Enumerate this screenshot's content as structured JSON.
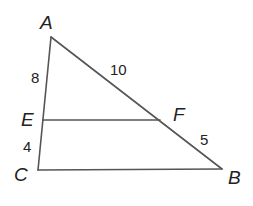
{
  "diagram": {
    "type": "triangle-with-parallel-segment",
    "stroke_color": "#555555",
    "text_color": "#222222",
    "vertices": {
      "A": {
        "label": "A",
        "x": 51,
        "y": 37
      },
      "B": {
        "label": "B",
        "x": 222,
        "y": 169
      },
      "C": {
        "label": "C",
        "x": 38,
        "y": 170
      },
      "E": {
        "label": "E",
        "x": 43,
        "y": 120
      },
      "F": {
        "label": "F",
        "x": 160,
        "y": 120
      }
    },
    "segments": [
      {
        "from": "A",
        "to": "C"
      },
      {
        "from": "A",
        "to": "B"
      },
      {
        "from": "C",
        "to": "B"
      },
      {
        "from": "E",
        "to": "F"
      }
    ],
    "measurements": {
      "AE": "8",
      "EC": "4",
      "AF": "10",
      "FB": "5"
    }
  }
}
